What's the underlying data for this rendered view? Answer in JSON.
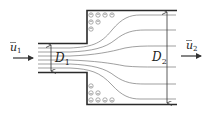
{
  "figure": {
    "type": "sudden-expansion-pipe-flow",
    "labels": {
      "inlet_velocity": {
        "symbol": "u",
        "subscript": "1",
        "overbar": true
      },
      "outlet_velocity": {
        "symbol": "u",
        "subscript": "2",
        "overbar": true
      },
      "inlet_diameter": {
        "symbol": "D",
        "subscript": "1"
      },
      "outlet_diameter": {
        "symbol": "D",
        "subscript": "2"
      }
    },
    "colors": {
      "wall": "#2a2a2a",
      "streamline": "#666666",
      "vortex": "#777777",
      "arrow": "#333333"
    }
  }
}
